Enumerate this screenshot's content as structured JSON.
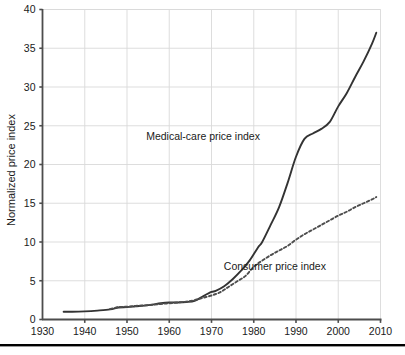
{
  "chart_data": {
    "type": "line",
    "title": "",
    "xlabel": "",
    "ylabel": "Normalized price index",
    "xlim": [
      1930,
      2010
    ],
    "ylim": [
      0,
      40
    ],
    "grid": true,
    "legend_position": "inline-annotations",
    "xticks": [
      "1930",
      "1940",
      "1950",
      "1960",
      "1970",
      "1980",
      "1990",
      "2000",
      "2010"
    ],
    "yticks": [
      "0",
      "5",
      "10",
      "15",
      "20",
      "25",
      "30",
      "35",
      "40"
    ],
    "series": [
      {
        "name": "Medical-care price index",
        "style": "solid",
        "color": "#333333",
        "label_x": 1968,
        "label_y": 23.2,
        "x": [
          1935,
          1937,
          1940,
          1943,
          1946,
          1948,
          1950,
          1952,
          1955,
          1958,
          1960,
          1962,
          1964,
          1966,
          1968,
          1970,
          1971,
          1973,
          1975,
          1977,
          1979,
          1981,
          1982,
          1984,
          1986,
          1988,
          1990,
          1992,
          1994,
          1996,
          1998,
          2000,
          2002,
          2004,
          2006,
          2008,
          2009
        ],
        "y": [
          1.0,
          1.0,
          1.05,
          1.15,
          1.3,
          1.55,
          1.6,
          1.7,
          1.85,
          2.1,
          2.2,
          2.2,
          2.25,
          2.4,
          3.0,
          3.55,
          3.7,
          4.3,
          5.2,
          6.3,
          7.6,
          9.3,
          10.0,
          12.2,
          14.5,
          17.6,
          21.0,
          23.3,
          24.0,
          24.6,
          25.5,
          27.5,
          29.2,
          31.3,
          33.3,
          35.6,
          37.0
        ]
      },
      {
        "name": "Consumer price index",
        "style": "dashed",
        "color": "#4d4d4d",
        "label_x": 1985,
        "label_y": 6.4,
        "x": [
          1946,
          1948,
          1950,
          1952,
          1955,
          1958,
          1960,
          1962,
          1964,
          1966,
          1968,
          1970,
          1972,
          1974,
          1976,
          1978,
          1980,
          1982,
          1984,
          1986,
          1988,
          1990,
          1992,
          1994,
          1996,
          1998,
          2000,
          2002,
          2004,
          2006,
          2008,
          2009
        ],
        "y": [
          1.35,
          1.6,
          1.65,
          1.75,
          1.85,
          2.0,
          2.1,
          2.2,
          2.3,
          2.5,
          2.8,
          3.1,
          3.5,
          4.2,
          4.9,
          5.6,
          6.8,
          7.6,
          8.3,
          8.9,
          9.5,
          10.3,
          11.0,
          11.6,
          12.2,
          12.8,
          13.4,
          13.9,
          14.5,
          15.0,
          15.5,
          15.8
        ]
      }
    ]
  },
  "colors": {
    "axis": "#4d4d4d",
    "grid": "#d9d9d9",
    "medical_line": "#333333",
    "consumer_line": "#4d4d4d",
    "text": "#1a1a1a",
    "rule": "#000000",
    "background": "#ffffff"
  }
}
